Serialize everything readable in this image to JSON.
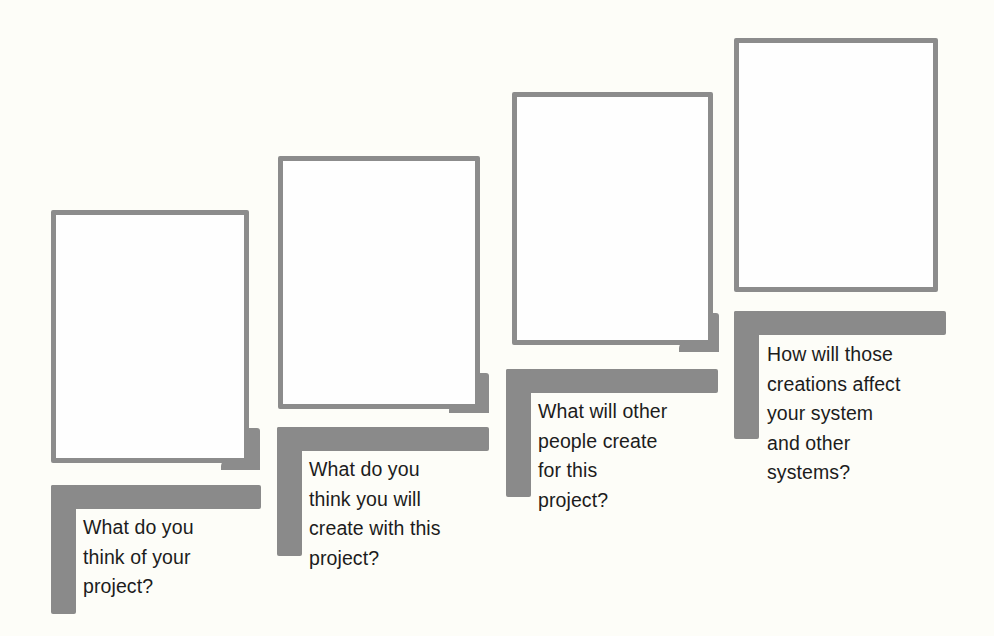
{
  "steps": [
    {
      "id": 1,
      "question": "What do you\nthink of your\nproject?",
      "answer_box": "empty",
      "has_corner_tab": true
    },
    {
      "id": 2,
      "question": "What do you\nthink you will\ncreate with this\nproject?",
      "answer_box": "empty",
      "has_corner_tab": true
    },
    {
      "id": 3,
      "question": "What will other\npeople create\nfor this\nproject?",
      "answer_box": "empty",
      "has_corner_tab": true
    },
    {
      "id": 4,
      "question": "How will those\ncreations affect\nyour system\nand other\nsystems?",
      "answer_box": "empty",
      "has_corner_tab": false
    }
  ],
  "colors": {
    "background": "#fdfdf8",
    "frame_border": "#8c8c8c",
    "bar": "#8a8a8a",
    "text": "#1c1c1c"
  }
}
